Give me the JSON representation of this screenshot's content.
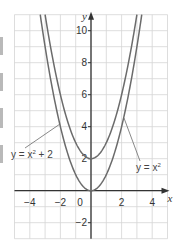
{
  "chart_data": {
    "type": "line",
    "title": "",
    "xlabel": "x",
    "ylabel": "y",
    "xlim": [
      -5,
      5
    ],
    "ylim": [
      -3,
      11
    ],
    "grid": true,
    "x_ticks": [
      -4,
      -2,
      0,
      2,
      4
    ],
    "x_tick_labels": [
      "−4",
      "−2",
      "0",
      "2",
      "4"
    ],
    "y_ticks": [
      -2,
      2,
      4,
      6,
      8,
      10
    ],
    "y_tick_labels": [
      "−2",
      "2",
      "4",
      "6",
      "8",
      "10"
    ],
    "series": [
      {
        "name": "y = x² + 2",
        "label_parts": {
          "lhs": "y = x",
          "exp": "2",
          "rhs": " + 2"
        },
        "function": "x^2 + 2",
        "x": [
          -3,
          -2,
          -1,
          0,
          1,
          2,
          3
        ],
        "values": [
          11,
          6,
          3,
          2,
          3,
          6,
          11
        ]
      },
      {
        "name": "y = x²",
        "label_parts": {
          "lhs": "y = x",
          "exp": "2",
          "rhs": ""
        },
        "function": "x^2",
        "x": [
          -3,
          -2,
          -1,
          0,
          1,
          2,
          3
        ],
        "values": [
          9,
          4,
          1,
          0,
          1,
          4,
          9
        ]
      }
    ],
    "annotations": [
      {
        "text": "y = x² + 2",
        "position": "left",
        "points_to": [
          -2,
          4
        ]
      },
      {
        "text": "y = x²",
        "position": "right",
        "points_to": [
          2,
          4.5
        ]
      }
    ],
    "colors": {
      "curve": "#6b6b6b",
      "axis": "#333333",
      "grid": "#d4d4d4"
    }
  }
}
